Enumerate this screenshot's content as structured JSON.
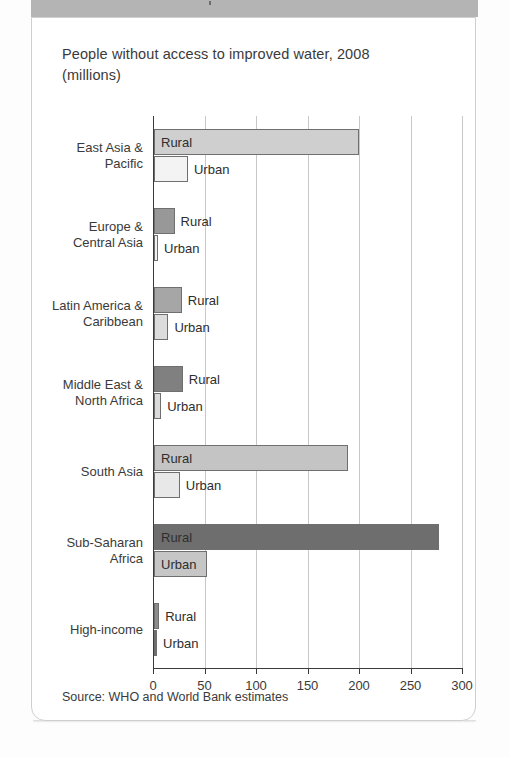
{
  "card": {
    "title": "People without access to improved water, 2008 (millions)",
    "title_line1": "People without access to improved water, 2008",
    "title_line2": "(millions)",
    "source": "Source: WHO and World Bank estimates"
  },
  "chart_data": {
    "type": "bar",
    "orientation": "horizontal",
    "title": "People without access to improved water, 2008 (millions)",
    "xlabel": "",
    "ylabel": "",
    "xlim": [
      0,
      300
    ],
    "xticks": [
      0,
      50,
      100,
      150,
      200,
      250,
      300
    ],
    "xtick_labels": [
      "0",
      "50",
      "100",
      "150",
      "200",
      "250",
      "300"
    ],
    "grid": true,
    "legend": "inline-labels",
    "categories": [
      "East Asia & Pacific",
      "Europe & Central Asia",
      "Latin America & Caribbean",
      "Middle East & North Africa",
      "South Asia",
      "Sub-Saharan Africa",
      "High-income"
    ],
    "series": [
      {
        "name": "Rural",
        "values": [
          199,
          20,
          27,
          28,
          188,
          277,
          5
        ]
      },
      {
        "name": "Urban",
        "values": [
          33,
          4,
          14,
          7,
          25,
          51,
          1
        ]
      }
    ],
    "source": "Source: WHO and World Bank estimates"
  },
  "categories": [
    {
      "label_line1": "East Asia &",
      "label_line2": "Pacific",
      "rural": {
        "label": "Rural",
        "value": 199,
        "color": "#cfcfcf",
        "label_inside": true
      },
      "urban": {
        "label": "Urban",
        "value": 33,
        "color": "#f3f3f3",
        "label_inside": false
      }
    },
    {
      "label_line1": "Europe &",
      "label_line2": "Central Asia",
      "rural": {
        "label": "Rural",
        "value": 20,
        "color": "#989898",
        "label_inside": false
      },
      "urban": {
        "label": "Urban",
        "value": 4,
        "color": "#f0f0f0",
        "label_inside": false
      }
    },
    {
      "label_line1": "Latin America &",
      "label_line2": "Caribbean",
      "rural": {
        "label": "Rural",
        "value": 27,
        "color": "#a6a6a6",
        "label_inside": false
      },
      "urban": {
        "label": "Urban",
        "value": 14,
        "color": "#dcdcdc",
        "label_inside": false
      }
    },
    {
      "label_line1": "Middle East &",
      "label_line2": "North Africa",
      "rural": {
        "label": "Rural",
        "value": 28,
        "color": "#808080",
        "label_inside": false
      },
      "urban": {
        "label": "Urban",
        "value": 7,
        "color": "#dadada",
        "label_inside": false
      }
    },
    {
      "label_line1": "South Asia",
      "label_line2": "",
      "rural": {
        "label": "Rural",
        "value": 188,
        "color": "#c4c4c4",
        "label_inside": true
      },
      "urban": {
        "label": "Urban",
        "value": 25,
        "color": "#e8e8e8",
        "label_inside": false
      }
    },
    {
      "label_line1": "Sub-Saharan",
      "label_line2": "Africa",
      "rural": {
        "label": "Rural",
        "value": 277,
        "color": "#6e6e6e",
        "label_inside": true
      },
      "urban": {
        "label": "Urban",
        "value": 51,
        "color": "#c6c6c6",
        "label_inside": true
      }
    },
    {
      "label_line1": "High-income",
      "label_line2": "",
      "rural": {
        "label": "Rural",
        "value": 5,
        "color": "#8c8c8c",
        "label_inside": false
      },
      "urban": {
        "label": "Urban",
        "value": 1,
        "color": "#6f6f6f",
        "label_inside": false
      }
    }
  ]
}
